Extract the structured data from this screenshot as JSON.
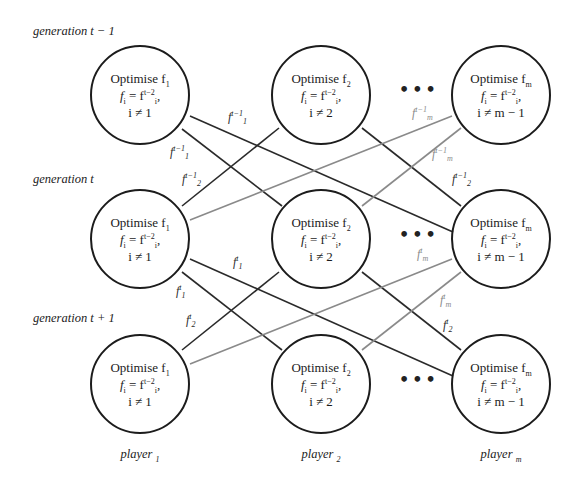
{
  "colors": {
    "node_border": "#1c1c1c",
    "edge_primary": "#2a2a2a",
    "edge_secondary": "#8a8a8a",
    "background": "#ffffff"
  },
  "generations": [
    {
      "label": "generation t − 1"
    },
    {
      "label": "generation t"
    },
    {
      "label": "generation t + 1"
    }
  ],
  "players": [
    {
      "label": "player",
      "sub": "1"
    },
    {
      "label": "player",
      "sub": "2"
    },
    {
      "label": "player",
      "sub": "m"
    }
  ],
  "nodes": {
    "col1": {
      "title": "Optimise f",
      "title_sub": "1",
      "line1_lhs": "f",
      "line1_lhs_sub": "i",
      "line1_rhs": " = f",
      "line1_rhs_sub": "i",
      "line1_rhs_sup": "t−2",
      "line1_tail": ",",
      "line2": "i ≠ 1"
    },
    "col2": {
      "title": "Optimise f",
      "title_sub": "2",
      "line1_lhs": "f",
      "line1_lhs_sub": "i",
      "line1_rhs": " = f",
      "line1_rhs_sub": "i",
      "line1_rhs_sup": "t−2",
      "line1_tail": ",",
      "line2": "i ≠ 2"
    },
    "colm": {
      "title": "Optimise f",
      "title_sub": "m",
      "line1_lhs": "f",
      "line1_lhs_sub": "i",
      "line1_rhs": " = f",
      "line1_rhs_sub": "i",
      "line1_rhs_sup": "t−2",
      "line1_tail": ",",
      "line2": "i ≠ m − 1"
    }
  },
  "ellipsis": "•••",
  "edge_labels": {
    "top": [
      {
        "base": "f",
        "sub": "1",
        "sup": "t−1",
        "tone": "black"
      },
      {
        "base": "f",
        "sub": "1",
        "sup": "t−1",
        "tone": "black"
      },
      {
        "base": "f",
        "sub": "2",
        "sup": "t−1",
        "tone": "black"
      },
      {
        "base": "f",
        "sub": "2",
        "sup": "t−1",
        "tone": "black"
      },
      {
        "base": "f",
        "sub": "m",
        "sup": "t−1",
        "tone": "gray"
      },
      {
        "base": "f",
        "sub": "m",
        "sup": "t−1",
        "tone": "gray"
      }
    ],
    "bottom": [
      {
        "base": "f",
        "sub": "1",
        "sup": "t",
        "tone": "black"
      },
      {
        "base": "f",
        "sub": "1",
        "sup": "t",
        "tone": "black"
      },
      {
        "base": "f",
        "sub": "2",
        "sup": "t",
        "tone": "black"
      },
      {
        "base": "f",
        "sub": "2",
        "sup": "t",
        "tone": "black"
      },
      {
        "base": "f",
        "sub": "m",
        "sup": "t",
        "tone": "gray"
      },
      {
        "base": "f",
        "sub": "m",
        "sup": "t",
        "tone": "gray"
      }
    ]
  }
}
